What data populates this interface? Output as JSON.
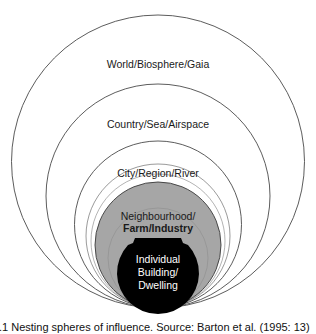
{
  "diagram": {
    "title": "Nesting spheres of influence",
    "levels": [
      {
        "label": "World/Biosphere/Gaia"
      },
      {
        "label": "Country/Sea/Airspace"
      },
      {
        "label": "City/Region/River"
      },
      {
        "label_line1": "Neighbourhood/",
        "label_line2": "Farm/Industry"
      },
      {
        "label_line1": "Individual",
        "label_line2": "Building/",
        "label_line3": "Dwelling"
      }
    ],
    "colors": {
      "outline": "#4a4a4a",
      "neighbourhood_fill": "#a6a6a6",
      "individual_fill": "#000000"
    }
  },
  "caption": ".1 Nesting spheres of influence. Source: Barton et al. (1995: 13)"
}
